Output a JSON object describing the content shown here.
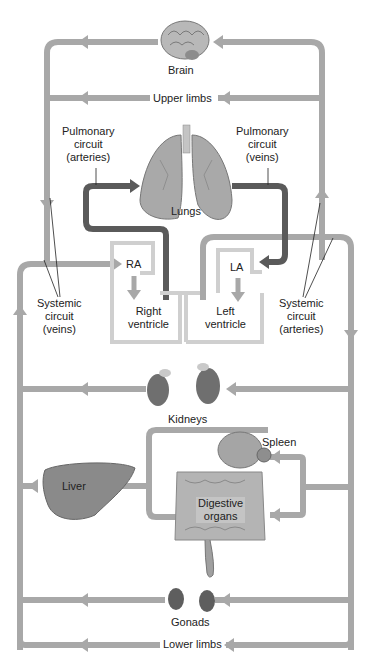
{
  "colors": {
    "systemic_pipe": "#a8a8a8",
    "pulmonary_pipe": "#5a5a5a",
    "heart_outline": "#cfcfcf",
    "organ_dark": "#6f6f6f",
    "organ_mid": "#9a9a9a",
    "text": "#222222"
  },
  "labels": {
    "brain": "Brain",
    "upper_limbs": "Upper limbs",
    "pulmonary_arteries": [
      "Pulmonary",
      "circuit",
      "(arteries)"
    ],
    "pulmonary_veins": [
      "Pulmonary",
      "circuit",
      "(veins)"
    ],
    "lungs": "Lungs",
    "ra": "RA",
    "la": "LA",
    "right_ventricle": [
      "Right",
      "ventricle"
    ],
    "left_ventricle": [
      "Left",
      "ventricle"
    ],
    "systemic_veins": [
      "Systemic",
      "circuit",
      "(veins)"
    ],
    "systemic_arteries": [
      "Systemic",
      "circuit",
      "(arteries)"
    ],
    "kidneys": "Kidneys",
    "spleen": "Spleen",
    "liver": "Liver",
    "digestive": [
      "Digestive",
      "organs"
    ],
    "gonads": "Gonads",
    "lower_limbs": "Lower limbs"
  }
}
